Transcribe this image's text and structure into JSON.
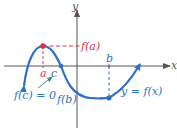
{
  "diagram": {
    "axes": {
      "x_label": "x",
      "y_label": "y"
    },
    "labels": {
      "fa": "f(a)",
      "a": "a",
      "c": "c",
      "b": "b",
      "fb": "f(b)",
      "fc": "f(c) = 0",
      "curve": "y = f(x)"
    },
    "colors": {
      "curve": "#2f6fc6",
      "max_marker": "#d8334a",
      "axis": "#555555",
      "min_marker": "#2f6fc6"
    },
    "points": {
      "local_max": {
        "name": "a",
        "value_label": "f(a)"
      },
      "zero": {
        "name": "c",
        "value_label": "f(c) = 0"
      },
      "local_min": {
        "name": "b",
        "value_label": "f(b)"
      }
    }
  }
}
